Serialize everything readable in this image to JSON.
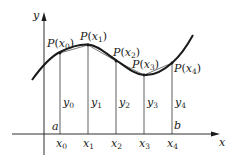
{
  "diagram": {
    "axes": {
      "x_label": "x",
      "y_label": "y"
    },
    "points": [
      {
        "label": "P",
        "arg": "x",
        "sub": "0"
      },
      {
        "label": "P",
        "arg": "x",
        "sub": "1"
      },
      {
        "label": "P",
        "arg": "x",
        "sub": "2"
      },
      {
        "label": "P",
        "arg": "x",
        "sub": "3"
      },
      {
        "label": "P",
        "arg": "x",
        "sub": "4"
      }
    ],
    "ordinates": [
      {
        "name": "y",
        "sub": "0"
      },
      {
        "name": "y",
        "sub": "1"
      },
      {
        "name": "y",
        "sub": "2"
      },
      {
        "name": "y",
        "sub": "3"
      },
      {
        "name": "y",
        "sub": "4"
      }
    ],
    "abscissas": [
      {
        "name": "x",
        "sub": "0"
      },
      {
        "name": "x",
        "sub": "1"
      },
      {
        "name": "x",
        "sub": "2"
      },
      {
        "name": "x",
        "sub": "3"
      },
      {
        "name": "x",
        "sub": "4"
      }
    ],
    "interval": {
      "start": "a",
      "end": "b"
    },
    "colors": {
      "stroke": "#1a1a1a",
      "background": "#ffffff"
    }
  }
}
